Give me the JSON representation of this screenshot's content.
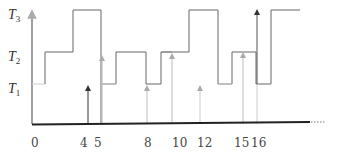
{
  "diagram": {
    "type": "step-timeline",
    "y_levels": [
      {
        "name": "T",
        "sub": "3",
        "id": "T3"
      },
      {
        "name": "T",
        "sub": "2",
        "id": "T2"
      },
      {
        "name": "T",
        "sub": "1",
        "id": "T1"
      }
    ],
    "x_ticks": [
      "0",
      "4",
      "5",
      "8",
      "10",
      "12",
      "15",
      "16"
    ],
    "step_sequence": [
      {
        "from": 0,
        "level": "T1"
      },
      {
        "level": "T2"
      },
      {
        "level": "T3"
      },
      {
        "at": 5,
        "level": "T1"
      },
      {
        "level": "T2"
      },
      {
        "at": 8,
        "level": "T1"
      },
      {
        "level": "T2"
      },
      {
        "level": "T3"
      },
      {
        "at": 12,
        "level": "T1"
      },
      {
        "level": "T2"
      },
      {
        "at": 16,
        "level": "T1"
      },
      {
        "level": "T3"
      }
    ],
    "arrivals": [
      {
        "x": "4",
        "level": "T1",
        "style": "dark"
      },
      {
        "x": "5",
        "level": "T2",
        "style": "light"
      },
      {
        "x": "8",
        "level": "T1",
        "style": "light"
      },
      {
        "x": "10",
        "level": "T2",
        "style": "light"
      },
      {
        "x": "12",
        "level": "T1",
        "style": "light"
      },
      {
        "x": "15",
        "level": "T2",
        "style": "light"
      },
      {
        "x": "16",
        "level": "T3",
        "style": "dark"
      }
    ],
    "axis_continues": "......",
    "colors": {
      "step": "#555555",
      "light": "#bbbbbb",
      "axis": "#222222",
      "dark_arrow": "#333333"
    }
  }
}
